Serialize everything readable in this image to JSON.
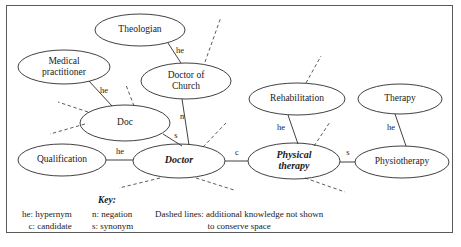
{
  "diagram": {
    "nodes": [
      {
        "id": "theologian",
        "label": "Theologian",
        "cx": 140,
        "cy": 30,
        "rx": 45,
        "ry": 16,
        "emphasis": "normal",
        "lines": [
          "Theologian"
        ]
      },
      {
        "id": "medical",
        "label": "Medical practitioner",
        "cx": 64,
        "cy": 67,
        "rx": 46,
        "ry": 17,
        "emphasis": "normal",
        "lines": [
          "Medical",
          "practitioner"
        ]
      },
      {
        "id": "doctor-church",
        "label": "Doctor of Church",
        "cx": 186,
        "cy": 81,
        "rx": 45,
        "ry": 18,
        "emphasis": "normal",
        "lines": [
          "Doctor of",
          "Church"
        ]
      },
      {
        "id": "doc",
        "label": "Doc",
        "cx": 125,
        "cy": 123,
        "rx": 45,
        "ry": 18,
        "emphasis": "normal",
        "lines": [
          "Doc"
        ]
      },
      {
        "id": "qualification",
        "label": "Qualification",
        "cx": 62,
        "cy": 160,
        "rx": 44,
        "ry": 16,
        "emphasis": "normal",
        "lines": [
          "Qualification"
        ]
      },
      {
        "id": "doctor",
        "label": "Doctor",
        "cx": 179,
        "cy": 161,
        "rx": 46,
        "ry": 17,
        "emphasis": "bold-italic",
        "lines": [
          "Doctor"
        ]
      },
      {
        "id": "rehabilitation",
        "label": "Rehabilitation",
        "cx": 297,
        "cy": 99,
        "rx": 48,
        "ry": 16,
        "emphasis": "normal",
        "lines": [
          "Rehabilitation"
        ]
      },
      {
        "id": "therapy",
        "label": "Therapy",
        "cx": 400,
        "cy": 99,
        "rx": 42,
        "ry": 15,
        "emphasis": "normal",
        "lines": [
          "Therapy"
        ]
      },
      {
        "id": "physical",
        "label": "Physical therapy",
        "cx": 294,
        "cy": 161,
        "rx": 46,
        "ry": 18,
        "emphasis": "bold-italic",
        "lines": [
          "Physical",
          "therapy"
        ]
      },
      {
        "id": "physio",
        "label": "Physiotherapy",
        "cx": 402,
        "cy": 162,
        "rx": 47,
        "ry": 16,
        "emphasis": "normal",
        "lines": [
          "Physiotherapy"
        ]
      }
    ],
    "edges": [
      {
        "from": "theologian",
        "to": "doctor-church",
        "label": "he",
        "x1": 168,
        "y1": 43,
        "x2": 181,
        "y2": 63,
        "lx": 180,
        "ly": 51
      },
      {
        "from": "medical",
        "to": "doc",
        "label": "he",
        "x1": 89,
        "y1": 81,
        "x2": 112,
        "y2": 106,
        "lx": 104,
        "ly": 91
      },
      {
        "from": "doctor-church",
        "to": "doctor",
        "label": "n",
        "x1": 182,
        "y1": 99,
        "x2": 189,
        "y2": 145,
        "lx": 182,
        "ly": 117
      },
      {
        "from": "doc",
        "to": "doctor",
        "label": "s",
        "x1": 163,
        "y1": 134,
        "x2": 182,
        "y2": 146,
        "lx": 176,
        "ly": 136
      },
      {
        "from": "qualification",
        "to": "doctor",
        "label": "he",
        "x1": 106,
        "y1": 160,
        "x2": 133,
        "y2": 160,
        "lx": 120,
        "ly": 152
      },
      {
        "from": "doctor",
        "to": "physical",
        "label": "c",
        "x1": 225,
        "y1": 161,
        "x2": 248,
        "y2": 161,
        "lx": 237,
        "ly": 153
      },
      {
        "from": "rehabilitation",
        "to": "physical",
        "label": "he",
        "x1": 288,
        "y1": 115,
        "x2": 298,
        "y2": 144,
        "lx": 281,
        "ly": 128
      },
      {
        "from": "therapy",
        "to": "physio",
        "label": "he",
        "x1": 395,
        "y1": 114,
        "x2": 406,
        "y2": 146,
        "lx": 391,
        "ly": 128
      },
      {
        "from": "physical",
        "to": "physio",
        "label": "s",
        "x1": 340,
        "y1": 162,
        "x2": 355,
        "y2": 162,
        "lx": 348,
        "ly": 153
      }
    ],
    "dashed_edges": [
      {
        "from": "doctor-church",
        "x1": 205,
        "y1": 62,
        "x2": 221,
        "y2": 17
      },
      {
        "from": "doc",
        "x1": 134,
        "y1": 106,
        "x2": 126,
        "y2": 85
      },
      {
        "from": "doc",
        "x1": 88,
        "y1": 112,
        "x2": 58,
        "y2": 102
      },
      {
        "from": "doc",
        "x1": 85,
        "y1": 124,
        "x2": 50,
        "y2": 134
      },
      {
        "from": "doctor",
        "x1": 203,
        "y1": 147,
        "x2": 226,
        "y2": 123
      },
      {
        "from": "doctor",
        "x1": 160,
        "y1": 178,
        "x2": 119,
        "y2": 188
      },
      {
        "from": "doctor",
        "x1": 196,
        "y1": 178,
        "x2": 234,
        "y2": 190
      },
      {
        "from": "rehabilitation",
        "x1": 306,
        "y1": 83,
        "x2": 321,
        "y2": 56
      },
      {
        "from": "physical",
        "x1": 314,
        "y1": 146,
        "x2": 330,
        "y2": 122
      },
      {
        "from": "physical",
        "x1": 305,
        "y1": 178,
        "x2": 345,
        "y2": 192
      }
    ],
    "legend": {
      "key_title": "Key:",
      "column_1": [
        "he: hypernym",
        "c: candidate"
      ],
      "column_2": [
        "n: negation",
        "s: synonym"
      ],
      "column_3": [
        "Dashed lines: additional knowledge not shown",
        "to conserve space"
      ]
    },
    "colors": {
      "stroke": "#2b2b2b",
      "dashed_stroke": "#4a4a4a",
      "border": "#5a5a5a",
      "background": "#ffffff",
      "text": "#1a1a1a"
    }
  }
}
